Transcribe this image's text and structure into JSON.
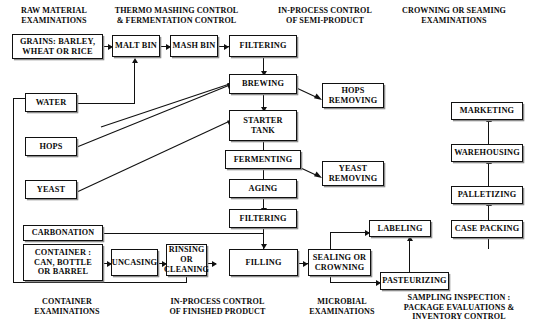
{
  "diagram": {
    "headers": [
      {
        "id": "raw-material",
        "text": "RAW MATERIAL\nEXAMINATIONS"
      },
      {
        "id": "thermo-mashing",
        "text": "THERMO MASHING CONTROL\n& FERMENTATION CONTROL"
      },
      {
        "id": "in-process-semi",
        "text": "IN-PROCESS CONTROL\nOF SEMI-PRODUCT"
      },
      {
        "id": "crowning-seaming",
        "text": "CROWNING OR SEAMING\nEXAMINATIONS"
      }
    ],
    "footers": [
      {
        "id": "container-exam",
        "text": "CONTAINER\nEXAMINATIONS"
      },
      {
        "id": "in-process-finished",
        "text": "IN-PROCESS CONTROL\nOF FINISHED PRODUCT"
      },
      {
        "id": "microbial-exam",
        "text": "MICROBIAL\nEXAMINATIONS"
      },
      {
        "id": "sampling-inspection",
        "text": "SAMPLING INSPECTION :\nPACKAGE EVALUATIONS &\nINVENTORY CONTROL"
      }
    ],
    "nodes": [
      {
        "id": "grains",
        "label": "GRAINS: BARLEY,\nWHEAT OR RICE"
      },
      {
        "id": "malt-bin",
        "label": "MALT BIN"
      },
      {
        "id": "mash-bin",
        "label": "MASH BIN"
      },
      {
        "id": "filtering-1",
        "label": "FILTERING"
      },
      {
        "id": "brewing",
        "label": "BREWING"
      },
      {
        "id": "hops-removing",
        "label": "HOPS\nREMOVING"
      },
      {
        "id": "starter-tank",
        "label": "STARTER\nTANK"
      },
      {
        "id": "fermenting",
        "label": "FERMENTING"
      },
      {
        "id": "yeast-removing",
        "label": "YEAST\nREMOVING"
      },
      {
        "id": "aging",
        "label": "AGING"
      },
      {
        "id": "filtering-2",
        "label": "FILTERING"
      },
      {
        "id": "water",
        "label": "WATER"
      },
      {
        "id": "hops",
        "label": "HOPS"
      },
      {
        "id": "yeast",
        "label": "YEAST"
      },
      {
        "id": "carbonation",
        "label": "CARBONATION"
      },
      {
        "id": "container",
        "label": "CONTAINER :\nCAN, BOTTLE\nOR BARREL"
      },
      {
        "id": "uncasing",
        "label": "UNCASING"
      },
      {
        "id": "rinsing",
        "label": "RINSING\nOR\nCLEANING"
      },
      {
        "id": "filling",
        "label": "FILLING"
      },
      {
        "id": "sealing",
        "label": "SEALING OR\nCROWNING"
      },
      {
        "id": "labeling",
        "label": "LABELING"
      },
      {
        "id": "pasteurizing",
        "label": "PASTEURIZING"
      },
      {
        "id": "case-packing",
        "label": "CASE PACKING"
      },
      {
        "id": "palletizing",
        "label": "PALLETIZING"
      },
      {
        "id": "warehousing",
        "label": "WAREHOUSING"
      },
      {
        "id": "marketing",
        "label": "MARKETING"
      }
    ],
    "edges": [
      {
        "from": "grains",
        "to": "malt-bin"
      },
      {
        "from": "malt-bin",
        "to": "mash-bin"
      },
      {
        "from": "mash-bin",
        "to": "filtering-1"
      },
      {
        "from": "water",
        "to": "malt-bin"
      },
      {
        "from": "water",
        "to": "brewing"
      },
      {
        "from": "water",
        "to": "rinsing"
      },
      {
        "from": "filtering-1",
        "to": "brewing"
      },
      {
        "from": "hops",
        "to": "brewing"
      },
      {
        "from": "brewing",
        "to": "hops-removing"
      },
      {
        "from": "brewing",
        "to": "starter-tank"
      },
      {
        "from": "yeast",
        "to": "starter-tank"
      },
      {
        "from": "starter-tank",
        "to": "fermenting"
      },
      {
        "from": "fermenting",
        "to": "yeast-removing"
      },
      {
        "from": "fermenting",
        "to": "aging"
      },
      {
        "from": "aging",
        "to": "filtering-2"
      },
      {
        "from": "filtering-2",
        "to": "filling"
      },
      {
        "from": "carbonation",
        "to": "filling"
      },
      {
        "from": "container",
        "to": "uncasing"
      },
      {
        "from": "uncasing",
        "to": "rinsing"
      },
      {
        "from": "rinsing",
        "to": "filling"
      },
      {
        "from": "filling",
        "to": "sealing"
      },
      {
        "from": "sealing",
        "to": "labeling"
      },
      {
        "from": "sealing",
        "to": "pasteurizing"
      },
      {
        "from": "pasteurizing",
        "to": "labeling"
      },
      {
        "from": "case-packing",
        "to": "palletizing"
      },
      {
        "from": "palletizing",
        "to": "warehousing"
      },
      {
        "from": "warehousing",
        "to": "marketing"
      }
    ]
  }
}
